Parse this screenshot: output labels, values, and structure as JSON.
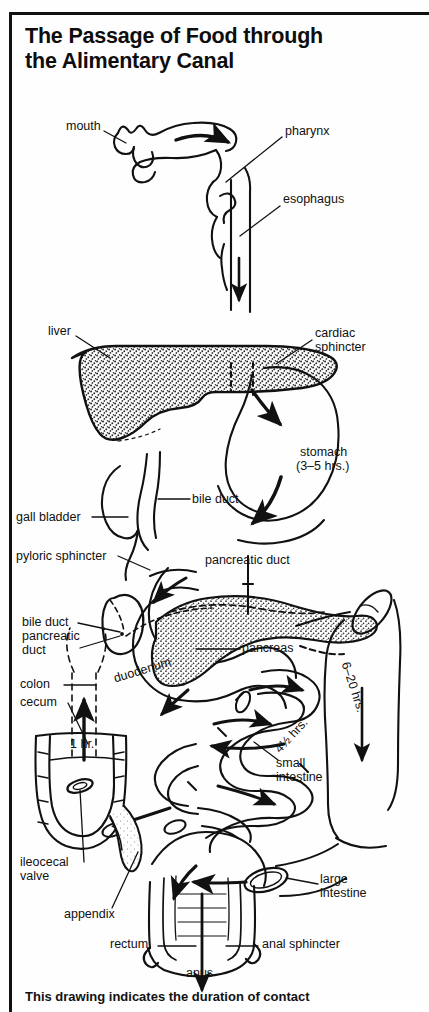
{
  "document": {
    "title_line1": "The Passage of Food through",
    "title_line2": "the Alimentary Canal",
    "caption": "This drawing indicates the duration of contact"
  },
  "colors": {
    "ink": "#111111",
    "paper": "#fefefe",
    "stipple": "#2a2a2a"
  },
  "diagram": {
    "type": "anatomical-flow-diagram",
    "labels": [
      {
        "id": "mouth",
        "text": "mouth",
        "x": 70,
        "y": 126
      },
      {
        "id": "pharynx",
        "text": "pharynx",
        "x": 285,
        "y": 131
      },
      {
        "id": "esophagus",
        "text": "esophagus",
        "x": 283,
        "y": 198
      },
      {
        "id": "liver",
        "text": "liver",
        "x": 50,
        "y": 331
      },
      {
        "id": "cardiac-sphincter",
        "text": "cardiac",
        "x": 315,
        "y": 333
      },
      {
        "id": "cardiac-sphincter2",
        "text": "sphincter",
        "x": 315,
        "y": 347
      },
      {
        "id": "stomach",
        "text": "stomach",
        "x": 300,
        "y": 452
      },
      {
        "id": "stomach-time",
        "text": "(3–5 hrs.)",
        "x": 297,
        "y": 466
      },
      {
        "id": "bile-duct",
        "text": "bile duct",
        "x": 193,
        "y": 495
      },
      {
        "id": "gall-bladder",
        "text": "gall bladder",
        "x": 18,
        "y": 513
      },
      {
        "id": "pyloric-sphincter",
        "text": "pyloric sphincter",
        "x": 18,
        "y": 552
      },
      {
        "id": "pancreatic-duct",
        "text": "pancreatic duct",
        "x": 206,
        "y": 560
      },
      {
        "id": "bile-duct-2",
        "text": "bile duct",
        "x": 24,
        "y": 619
      },
      {
        "id": "pancreatic-2a",
        "text": "pancreatic",
        "x": 24,
        "y": 633
      },
      {
        "id": "pancreatic-2b",
        "text": "duct",
        "x": 24,
        "y": 647
      },
      {
        "id": "pancreas",
        "text": "pancreas",
        "x": 243,
        "y": 645
      },
      {
        "id": "colon",
        "text": "colon",
        "x": 22,
        "y": 681
      },
      {
        "id": "cecum",
        "text": "cecum",
        "x": 22,
        "y": 699
      },
      {
        "id": "duodenum",
        "text": "duodenum",
        "x": 116,
        "y": 682
      },
      {
        "id": "large-int-time",
        "text": "6–20 hrs.",
        "x": 350,
        "y": 672
      },
      {
        "id": "one-hr",
        "text": "1 hr.",
        "x": 72,
        "y": 744
      },
      {
        "id": "small-int-time",
        "text": "4½ hrs.",
        "x": 273,
        "y": 735
      },
      {
        "id": "small-intestine",
        "text": "small",
        "x": 276,
        "y": 763
      },
      {
        "id": "small-intestine2",
        "text": "intestine",
        "x": 276,
        "y": 777
      },
      {
        "id": "ileocecal-valve",
        "text": "ileocecal",
        "x": 22,
        "y": 861
      },
      {
        "id": "ileocecal-valve2",
        "text": "valve",
        "x": 22,
        "y": 875
      },
      {
        "id": "large-intestine",
        "text": "large",
        "x": 320,
        "y": 879
      },
      {
        "id": "large-intestine2",
        "text": "intestine",
        "x": 320,
        "y": 893
      },
      {
        "id": "appendix",
        "text": "appendix",
        "x": 66,
        "y": 913
      },
      {
        "id": "rectum",
        "text": "rectum",
        "x": 112,
        "y": 942
      },
      {
        "id": "anal-sphincter",
        "text": "anal sphincter",
        "x": 263,
        "y": 942
      },
      {
        "id": "anus",
        "text": "anus",
        "x": 202,
        "y": 972
      }
    ],
    "transit_times": [
      {
        "organ": "stomach",
        "value": "3–5 hrs."
      },
      {
        "organ": "small intestine",
        "value": "4½ hrs."
      },
      {
        "organ": "cecum",
        "value": "1 hr."
      },
      {
        "organ": "large intestine",
        "value": "6–20 hrs."
      }
    ]
  }
}
